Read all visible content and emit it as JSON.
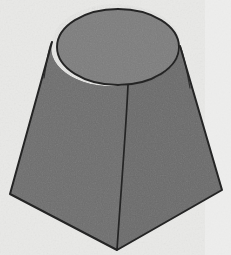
{
  "figure": {
    "title": "Shaded geometric solid",
    "description": "A conical frustum resting on / merged with a square-based pyramidal frustum, rendered as a flat shaded line drawing on a light gray background.",
    "shape_name": "cone-on-pyramid-frustum",
    "background_color": "#e9e9e7",
    "outline_color": "#242424",
    "canvas": {
      "width": 231,
      "height": 255
    }
  },
  "faces": [
    {
      "id": "top-face",
      "label": "Circular top face",
      "fill": "#7d7d7d",
      "kind": "ellipse",
      "center_x": 118,
      "center_y": 47,
      "radius_x": 61,
      "radius_y": 38
    },
    {
      "id": "left-face",
      "label": "Left lateral face",
      "fill": "#6d6d6d",
      "kind": "polygon",
      "points": "52,42 10,194 117,250 128,85"
    },
    {
      "id": "right-face",
      "label": "Right lateral face",
      "fill": "#6b6b6b",
      "kind": "polygon",
      "points": "128,85 117,250 222,190 180,46"
    },
    {
      "id": "left-sliver",
      "label": "Left curved sliver between cone and pyramid edge",
      "fill": "#737373",
      "kind": "region"
    },
    {
      "id": "right-sliver",
      "label": "Right curved sliver between cone and pyramid edge",
      "fill": "#737373",
      "kind": "region"
    }
  ],
  "edges": [
    {
      "id": "top-rim",
      "label": "Top circular rim",
      "type": "ellipse-outline"
    },
    {
      "id": "left-slant-edge",
      "label": "Left slanted edge",
      "from_x": 52,
      "from_y": 42,
      "to_x": 10,
      "to_y": 194
    },
    {
      "id": "right-slant-edge",
      "label": "Right slanted edge",
      "from_x": 180,
      "from_y": 46,
      "to_x": 222,
      "to_y": 190
    },
    {
      "id": "front-vertical-edge",
      "label": "Front vertical edge",
      "from_x": 128,
      "from_y": 85,
      "to_x": 117,
      "to_y": 250
    },
    {
      "id": "bottom-left-edge",
      "label": "Bottom-left base edge",
      "from_x": 10,
      "from_y": 194,
      "to_x": 117,
      "to_y": 250
    },
    {
      "id": "bottom-right-edge",
      "label": "Bottom-right base edge",
      "from_x": 117,
      "from_y": 250,
      "to_x": 222,
      "to_y": 190
    }
  ],
  "vertices": [
    {
      "id": "base-left",
      "label": "Base left corner",
      "x": 10,
      "y": 194
    },
    {
      "id": "base-front",
      "label": "Base front corner",
      "x": 117,
      "y": 250
    },
    {
      "id": "base-right",
      "label": "Base right corner",
      "x": 222,
      "y": 190
    },
    {
      "id": "rim-left",
      "label": "Left rim tangent point",
      "x": 52,
      "y": 42
    },
    {
      "id": "rim-right",
      "label": "Right rim tangent point",
      "x": 180,
      "y": 46
    },
    {
      "id": "rim-front",
      "label": "Front rim point",
      "x": 128,
      "y": 85
    }
  ]
}
